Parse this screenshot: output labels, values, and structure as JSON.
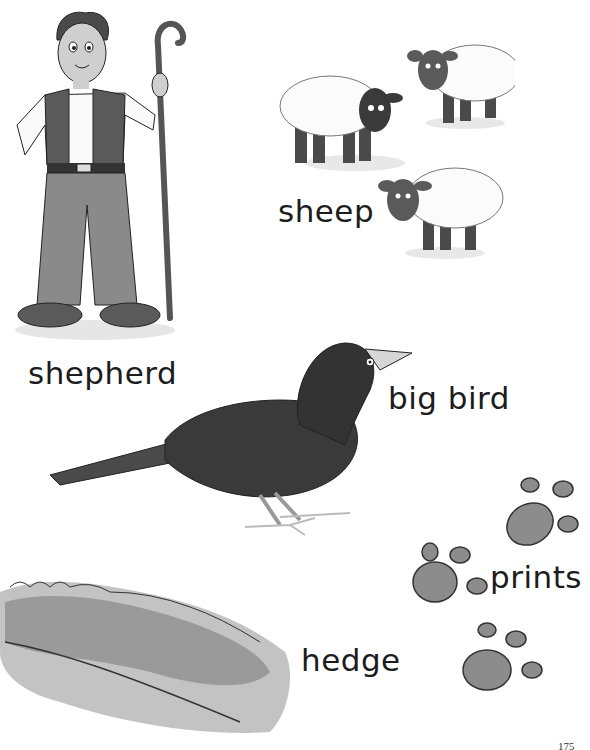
{
  "page": {
    "page_number": "175",
    "background": "#ffffff"
  },
  "vocabulary": [
    {
      "word": "shepherd",
      "illustration": "shepherd-illustration"
    },
    {
      "word": "sheep",
      "illustration": "sheep-illustration"
    },
    {
      "word": "big bird",
      "illustration": "bird-illustration"
    },
    {
      "word": "prints",
      "illustration": "paw-prints-illustration"
    },
    {
      "word": "hedge",
      "illustration": "hedge-illustration"
    }
  ]
}
